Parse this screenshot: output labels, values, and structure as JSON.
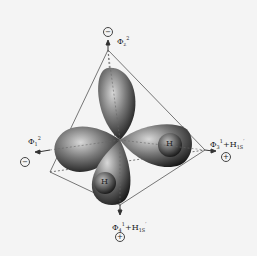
{
  "diagram": {
    "type": "sp3 hybrid orbital tetrahedron",
    "labels": {
      "top": {
        "base": "Φ",
        "sub": "z",
        "sup": "2"
      },
      "left": {
        "base": "Φ",
        "sub": "1",
        "sup": "2"
      },
      "right": {
        "base": "Φ",
        "sub": "3",
        "sup": "1",
        "plus": "+H",
        "plus_sub": "1S",
        "plus_sup": "′"
      },
      "bottom": {
        "base": "Φ",
        "sub": "4",
        "sup": "1",
        "plus": "+H",
        "plus_sub": "1S",
        "plus_sup": "′"
      }
    },
    "signs": {
      "top": "−",
      "left": "−",
      "right": "+",
      "bottom": "+"
    },
    "atoms": {
      "right": "H",
      "bottom": "H"
    },
    "colors": {
      "background": "#f4f4f4",
      "lobe_dark": "#1a1a1a",
      "lobe_light": "#bdbdbd",
      "line": "#444444"
    }
  }
}
